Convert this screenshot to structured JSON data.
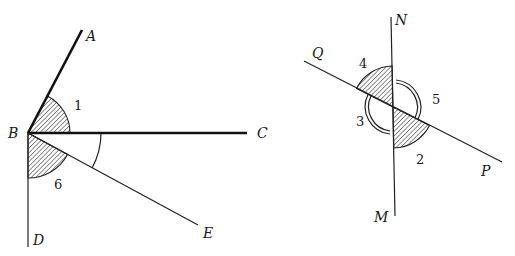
{
  "diagram": {
    "left_figure": {
      "vertex": "B",
      "rays": [
        {
          "name": "BA",
          "endpoint_label": "A",
          "style": "thick"
        },
        {
          "name": "BC",
          "endpoint_label": "C",
          "style": "thick"
        },
        {
          "name": "BE",
          "endpoint_label": "E",
          "style": "thin"
        },
        {
          "name": "BD",
          "endpoint_label": "D",
          "style": "thin"
        }
      ],
      "angles": [
        {
          "label": "1",
          "between": [
            "BA",
            "BC"
          ],
          "marking": "hatched"
        },
        {
          "label": "6",
          "between": [
            "BE",
            "BD"
          ],
          "marking": "hatched"
        },
        {
          "label": "",
          "between": [
            "BC",
            "BE"
          ],
          "marking": "single-arc"
        }
      ],
      "labels": {
        "A": "A",
        "B": "B",
        "C": "C",
        "D": "D",
        "E": "E",
        "angle1": "1",
        "angle6": "6"
      }
    },
    "right_figure": {
      "lines": [
        {
          "name": "NM",
          "endpoints": [
            "N",
            "M"
          ]
        },
        {
          "name": "QP",
          "endpoints": [
            "Q",
            "P"
          ]
        }
      ],
      "angles": [
        {
          "label": "4",
          "between": [
            "N",
            "Q"
          ],
          "marking": "hatched"
        },
        {
          "label": "2",
          "between": [
            "M",
            "P"
          ],
          "marking": "hatched"
        },
        {
          "label": "5",
          "between": [
            "N",
            "P"
          ],
          "marking": "double-arc"
        },
        {
          "label": "3",
          "between": [
            "Q",
            "M"
          ],
          "marking": "double-arc"
        }
      ],
      "labels": {
        "N": "N",
        "M": "M",
        "Q": "Q",
        "P": "P",
        "angle2": "2",
        "angle3": "3",
        "angle4": "4",
        "angle5": "5"
      }
    }
  }
}
